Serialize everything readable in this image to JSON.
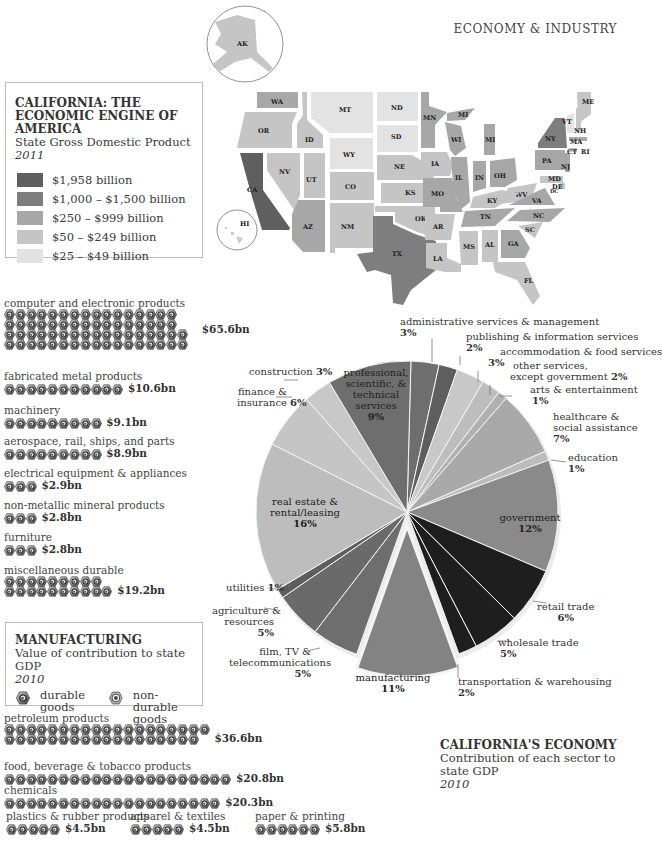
{
  "header": {
    "section_title": "ECONOMY & INDUSTRY"
  },
  "map_legend": {
    "title": "CALIFORNIA: THE ECONOMIC ENGINE OF AMERICA",
    "subtitle": "State Gross Domestic Product",
    "year": "2011",
    "items": [
      {
        "label": "$1,958 billion",
        "color": "#5f5f5f"
      },
      {
        "label": "$1,000 – $1,500 billion",
        "color": "#7e7e7e"
      },
      {
        "label": "$250 – $999 billion",
        "color": "#a7a7a7"
      },
      {
        "label": "$50 – $249 billion",
        "color": "#c5c5c5"
      },
      {
        "label": "$25 – $49 billion",
        "color": "#e3e3e3"
      }
    ]
  },
  "map": {
    "states": [
      "AK",
      "HI",
      "WA",
      "OR",
      "CA",
      "ID",
      "NV",
      "UT",
      "AZ",
      "MT",
      "WY",
      "CO",
      "NM",
      "ND",
      "SD",
      "NE",
      "KS",
      "OK",
      "TX",
      "MN",
      "IA",
      "MO",
      "AR",
      "LA",
      "WI",
      "IL",
      "MI",
      "IN",
      "OH",
      "KY",
      "TN",
      "MS",
      "AL",
      "GA",
      "FL",
      "SC",
      "NC",
      "VA",
      "WV",
      "PA",
      "NY",
      "VT",
      "NH",
      "ME",
      "MA",
      "CT",
      "RI",
      "NJ",
      "MD",
      "DE",
      "DC"
    ]
  },
  "manufacturing": {
    "title": "MANUFACTURING",
    "subtitle": "Value of contribution to state GDP",
    "year": "2010",
    "key_durable": "durable goods",
    "key_durable_l1": "durable",
    "key_durable_l2": "goods",
    "key_nondurable_l1": "non-durable",
    "key_nondurable_l2": "goods",
    "durable": [
      {
        "label": "computer and electronic products",
        "value": "$65.6bn",
        "rows": [
          16,
          16,
          17,
          17
        ]
      },
      {
        "label": "fabricated metal products",
        "value": "$10.6bn",
        "rows": [
          11
        ]
      },
      {
        "label": "machinery",
        "value": "$9.1bn",
        "rows": [
          9
        ]
      },
      {
        "label": "aerospace, rail, ships, and parts",
        "value": "$8.9bn",
        "rows": [
          9
        ]
      },
      {
        "label": "electrical equipment & appliances",
        "value": "$2.9bn",
        "rows": [
          3
        ]
      },
      {
        "label": "non-metallic mineral products",
        "value": "$2.8bn",
        "rows": [
          3
        ]
      },
      {
        "label": "furniture",
        "value": "$2.8bn",
        "rows": [
          3
        ]
      },
      {
        "label": "miscellaneous durable",
        "value": "$19.2bn",
        "rows": [
          9,
          10
        ]
      }
    ],
    "nondurable": [
      {
        "label": "petroleum products",
        "value": "$36.6bn",
        "rows": [
          19,
          18
        ]
      },
      {
        "label": "food, beverage & tobacco products",
        "value": "$20.8bn",
        "rows": [
          21
        ]
      },
      {
        "label": "chemicals",
        "value": "$20.3bn",
        "rows": [
          20
        ]
      },
      {
        "label": "plastics & rubber products",
        "value": "$4.5bn",
        "rows": [
          5
        ]
      },
      {
        "label": "apparel & textiles",
        "value": "$4.5bn",
        "rows": [
          5
        ]
      },
      {
        "label": "paper & printing",
        "value": "$5.8bn",
        "rows": [
          6
        ]
      }
    ]
  },
  "economy": {
    "title": "CALIFORNIA'S ECONOMY",
    "subtitle_l1": "Contribution of each sector to",
    "subtitle_l2": "state GDP",
    "year": "2010"
  },
  "chart_data": {
    "type": "pie",
    "categories": [
      "administrative services & management",
      "publishing & information services",
      "accommodation & food services",
      "other services, except government",
      "arts & entertainment",
      "healthcare & social assistance",
      "education",
      "government",
      "retail trade",
      "wholesale trade",
      "transportation & warehousing",
      "manufacturing",
      "film, TV & telecommunications",
      "agriculture & resources",
      "utilities",
      "real estate & rental/leasing",
      "finance & insurance",
      "construction",
      "professional, scientific, & technical services"
    ],
    "values": [
      3,
      2,
      3,
      2,
      1,
      7,
      1,
      12,
      6,
      5,
      2,
      11,
      5,
      5,
      1,
      16,
      6,
      3,
      9
    ],
    "colors": [
      "#6e6e6e",
      "#5e5e5e",
      "#c8c8c8",
      "#bdbdbd",
      "#b0b0b0",
      "#a9a9a9",
      "#bcbcbc",
      "#8a8a8a",
      "#1e1e1e",
      "#1e1e1e",
      "#1e1e1e",
      "#838383",
      "#6e6e6e",
      "#6a6a6a",
      "#5e5e5e",
      "#bdbdbd",
      "#c5c5c5",
      "#c8c8c8",
      "#6e6e6e"
    ],
    "exploded": "manufacturing",
    "unit": "%"
  },
  "pie_labels": {
    "admin_l1": "administrative services & management",
    "admin_pct": "3%",
    "pub_l1": "publishing & information services",
    "pub_pct": "2%",
    "accom_l1": "accommodation & food services",
    "accom_pct": "3%",
    "other_l1": "other services,",
    "other_l2": "except government",
    "other_pct": "2%",
    "arts_l1": "arts & entertainment",
    "arts_pct": "1%",
    "health_l1": "healthcare &",
    "health_l2": "social assistance",
    "health_pct": "7%",
    "edu_l1": "education",
    "edu_pct": "1%",
    "gov_l1": "government",
    "gov_pct": "12%",
    "retail_l1": "retail trade",
    "retail_pct": "6%",
    "whole_l1": "wholesale trade",
    "whole_pct": "5%",
    "trans_l1": "transportation & warehousing",
    "trans_pct": "2%",
    "mfg_l1": "manufacturing",
    "mfg_pct": "11%",
    "film_l1": "film, TV &",
    "film_l2": "telecommunications",
    "film_pct": "5%",
    "agri_l1": "agriculture &",
    "agri_l2": "resources",
    "agri_pct": "5%",
    "util_l1": "utilities",
    "util_pct": "1%",
    "real_l1": "real estate &",
    "real_l2": "rental/leasing",
    "real_pct": "16%",
    "fin_l1": "finance &",
    "fin_l2": "insurance",
    "fin_pct": "6%",
    "cons_l1": "construction",
    "cons_pct": "3%",
    "prof_l1": "professional,",
    "prof_l2": "scientific, &",
    "prof_l3": "technical",
    "prof_l4": "services",
    "prof_pct": "9%"
  }
}
